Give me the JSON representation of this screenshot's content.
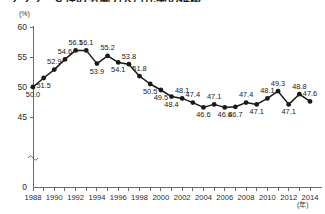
{
  "chart_data": {
    "type": "line",
    "title": "グラフ　女性の労働力人口比率の推移",
    "xlabel": "(年)",
    "ylabel": "(%)",
    "ylim": [
      0,
      60
    ],
    "grid": false,
    "legend": "none",
    "y_ticks": [
      "0",
      "45",
      "50",
      "55",
      "60"
    ],
    "y_axis_break": true,
    "y_axis_break_symbol": "≈",
    "x_ticks": [
      "1988",
      "1990",
      "1992",
      "1994",
      "1996",
      "1998",
      "2000",
      "2002",
      "2004",
      "2006",
      "2008",
      "2010",
      "2012",
      "2014"
    ],
    "x": [
      1988,
      1989,
      1990,
      1991,
      1992,
      1993,
      1994,
      1995,
      1996,
      1997,
      1998,
      1999,
      2000,
      2001,
      2002,
      2003,
      2004,
      2005,
      2006,
      2007,
      2008,
      2009,
      2010,
      2011,
      2012,
      2013,
      2014
    ],
    "categories": [
      "1988",
      "1989",
      "1990",
      "1991",
      "1992",
      "1993",
      "1994",
      "1995",
      "1996",
      "1997",
      "1998",
      "1999",
      "2000",
      "2001",
      "2002",
      "2003",
      "2004",
      "2005",
      "2006",
      "2007",
      "2008",
      "2009",
      "2010",
      "2011",
      "2012",
      "2013",
      "2014"
    ],
    "values": [
      50.0,
      51.5,
      52.9,
      54.6,
      56.1,
      56.1,
      53.9,
      55.2,
      54.1,
      53.8,
      51.8,
      50.5,
      49.5,
      48.4,
      48.1,
      47.4,
      46.6,
      47.1,
      46.6,
      46.7,
      47.4,
      47.1,
      48.1,
      49.3,
      47.1,
      48.8,
      47.6
    ],
    "point_labels": [
      "50.0",
      "51.5",
      "52.9",
      "54.6",
      "56.1",
      "56.1",
      "53.9",
      "55.2",
      "54.1",
      "53.8",
      "51.8",
      "50.5",
      "49.5",
      "48.4",
      "48.1",
      "47.4",
      "46.6",
      "47.1",
      "46.6",
      "46.7",
      "47.4",
      "47.1",
      "48.1",
      "49.3",
      "47.1",
      "48.8",
      "47.6"
    ],
    "label_positions": [
      "below",
      "below",
      "above",
      "above",
      "above",
      "above",
      "below",
      "above",
      "below",
      "above",
      "above",
      "below",
      "below",
      "below",
      "above",
      "above",
      "below",
      "above",
      "below",
      "below",
      "above",
      "below",
      "above",
      "above",
      "below",
      "above",
      "above"
    ],
    "series": [
      {
        "name": "女性の労働力人口比率",
        "color": "#1a1a1a",
        "values": [
          50.0,
          51.5,
          52.9,
          54.6,
          56.1,
          56.1,
          53.9,
          55.2,
          54.1,
          53.8,
          51.8,
          50.5,
          49.5,
          48.4,
          48.1,
          47.4,
          46.6,
          47.1,
          46.6,
          46.7,
          47.4,
          47.1,
          48.1,
          49.3,
          47.1,
          48.8,
          47.6
        ]
      }
    ]
  }
}
